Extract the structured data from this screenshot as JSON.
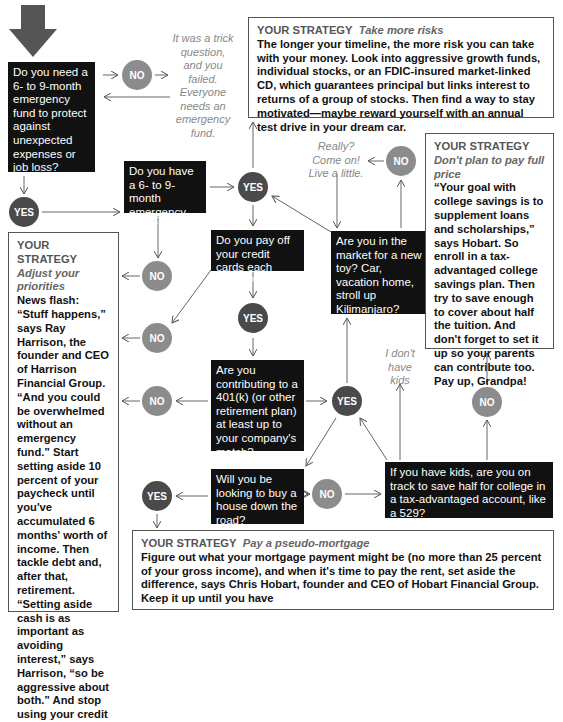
{
  "flowchart": {
    "start_icon": "down-arrow-icon",
    "colors": {
      "question_bg": "#111111",
      "yes_circle": "#4a4a4a",
      "no_circle": "#8c8c8c",
      "strategy_border": "#555555",
      "aside_text": "#888888"
    },
    "questions": {
      "q_need_fund": "Do you need a 6- to 9-month emergency fund to protect against unexpected expenses or job loss?",
      "q_have_fund": "Do you have a 6- to 9-month emergency fund?",
      "q_credit_cards": "Do you pay off your credit cards each month?",
      "q_new_toy": "Are you in the market for a new toy? Car, vacation home, stroll up Kilimanjaro?",
      "q_401k": "Are you contributing to a 401(k) (or other retirement plan) at least up to your company's match?",
      "q_house": "Will you be looking to buy a house down the road?",
      "q_kids_college": "If you have kids, are you on track to save half for college in a tax-advantaged account, like a 529?"
    },
    "answers": {
      "yes": "YES",
      "no": "NO"
    },
    "asides": {
      "trick_question": "It was a trick question, and you failed. Everyone needs an emergency fund.",
      "really": "Really? Come on! Live a little.",
      "no_kids": "I don't have kids"
    },
    "strategies": {
      "take_risks": {
        "label": "YOUR STRATEGY",
        "title": "Take more risks",
        "body": "The longer your timeline, the more risk you can take with your money. Look into aggressive growth funds, individual stocks, or an FDIC-insured market-linked CD, which guarantees principal but links interest to returns of a group of stocks. Then find a way to stay motivated—maybe reward yourself with an annual test drive in your dream car."
      },
      "college": {
        "label": "YOUR STRATEGY",
        "title": "Don't plan to pay full price",
        "body": "“Your goal with college savings is to supplement loans and scholarships,” says Hobart. So enroll in a tax-advantaged college savings plan. Then try to save enough to cover about half the tuition. And don't forget to set it up so your parents can contribute too. Pay up, Grandpa!"
      },
      "priorities": {
        "label": "YOUR STRATEGY",
        "title": "Adjust your priorities",
        "body": "News flash: “Stuff happens,” says Ray Harrison, the founder and CEO of Harrison Financial Group. “And you could be overwhelmed without an emergency fund.” Start setting aside 10 percent of your paycheck until you've accumulated 6 months' worth of income. Then tackle debt and, after that, retirement. “Setting aside cash is as important as avoiding interest,” says Harrison, “so be aggressive about both.” And stop using your credit"
      },
      "pseudo_mortgage": {
        "label": "YOUR STRATEGY",
        "title": "Pay a pseudo-mortgage",
        "body": "Figure out what your mortgage payment might be (no more than 25 percent of your gross income), and when it's time to pay the rent, set aside the difference, says Chris Hobart, founder and CEO of Hobart Financial Group. Keep it up until you have"
      }
    }
  }
}
